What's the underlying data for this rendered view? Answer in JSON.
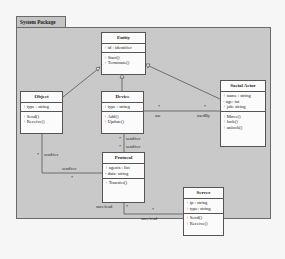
{
  "package": {
    "name": "System Package"
  },
  "classes": {
    "entity": {
      "name": "Entity",
      "attributes": [
        "+ id : identifier"
      ],
      "operations": [
        "+ Start()",
        "+ Terminate()"
      ]
    },
    "object": {
      "name": "Object",
      "attributes": [
        "+ type : string"
      ],
      "operations": [
        "+ Send()",
        "+ Receive()"
      ]
    },
    "device": {
      "name": "Device",
      "attributes": [
        "+ type : string"
      ],
      "operations": [
        "+ Add()",
        "+ Update()"
      ]
    },
    "social_actor": {
      "name": "Social Actor",
      "attributes": [
        "+ name : string",
        "- age: int",
        "+ job: string"
      ],
      "operations": [
        "+ Move()",
        "+ lock()",
        "+ unlock()"
      ]
    },
    "protocol": {
      "name": "Protocol",
      "attributes": [
        "+ agents : list",
        "- data: string"
      ],
      "operations": [
        "+ Transfer()"
      ]
    },
    "server": {
      "name": "Server",
      "attributes": [
        "+ ip : string",
        "+ type: string"
      ],
      "operations": [
        "+ Send()",
        "+ Receive()"
      ]
    }
  },
  "relations": {
    "generalizations": [
      {
        "from": "Object",
        "to": "Entity"
      },
      {
        "from": "Device",
        "to": "Entity"
      },
      {
        "from": "Social Actor",
        "to": "Entity"
      }
    ],
    "device_social": {
      "left_mult": "*",
      "left_role": "use",
      "right_mult": "*",
      "right_role": "usedBy"
    },
    "device_protocol": {
      "top_mult": "*",
      "top_role": "send/rec",
      "bottom_mult": "*",
      "bottom_role": "send/rec"
    },
    "object_protocol": {
      "object_mult": "*",
      "object_role": "send/rec",
      "protocol_role": "send/rec",
      "protocol_mult": "*"
    },
    "protocol_server": {
      "protocol_role": "save/read",
      "protocol_mult": "*",
      "server_mult": "*",
      "server_role": "save/read"
    }
  }
}
